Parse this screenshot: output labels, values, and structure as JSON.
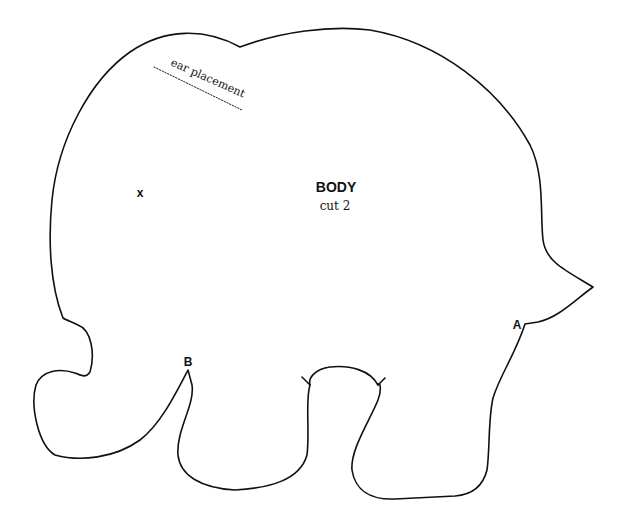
{
  "pattern": {
    "piece_name": "BODY",
    "cut_instruction": "cut 2",
    "ear_placement_label": "ear placement",
    "marker_x": "x",
    "marker_a": "A",
    "marker_b": "B"
  },
  "colors": {
    "line": "#111111",
    "background": "#ffffff"
  }
}
